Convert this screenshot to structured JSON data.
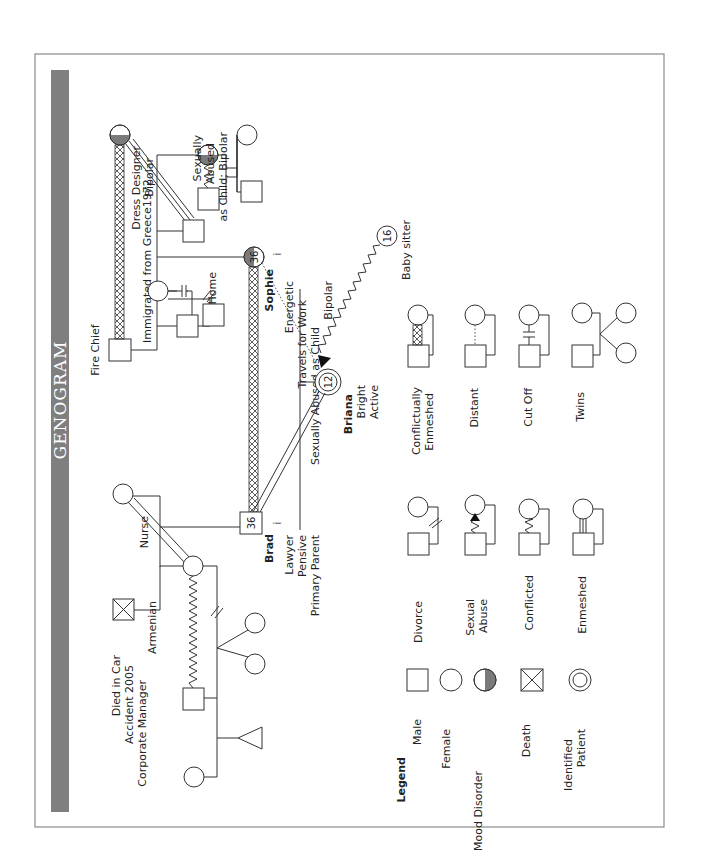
{
  "title": "GENOGRAM",
  "colors": {
    "banner": "#7f7f7f",
    "frame": "#8a8a8a",
    "mood_shade": "#7a7a7a",
    "line": "#333333"
  },
  "people": {
    "paternal_grandfather": {
      "label": "Died in Car Accident 2005 Corporate Manager",
      "lines": [
        "Died in Car",
        "Accident 2005",
        "Corporate Manager"
      ],
      "symbol": "male-deceased"
    },
    "paternal_grandmother": {
      "label": "Armenian",
      "symbol": "female"
    },
    "nurse": {
      "label": "Nurse",
      "symbol": "female"
    },
    "brad": {
      "name": "Brad",
      "age": "36",
      "sep": "i",
      "lines": [
        "Lawyer",
        "Pensive",
        "Primary Parent"
      ],
      "symbol": "male"
    },
    "sophie": {
      "name": "Sophie",
      "age": "36",
      "sep": "i",
      "lines": [
        "Energetic",
        "Travels for Work",
        "Sexually Abused as Child",
        "Bipolar"
      ],
      "symbol": "female-mood"
    },
    "briana": {
      "name": "Briana",
      "age": "12",
      "lines": [
        "Bright",
        "Active"
      ],
      "symbol": "identified-patient"
    },
    "babysitter": {
      "age": "16",
      "label": "Baby sitter",
      "symbol": "female"
    },
    "fire_chief": {
      "label": "Fire Chief",
      "symbol": "male"
    },
    "dress_designer": {
      "lines": [
        "Dress Designer",
        "Bipolar"
      ],
      "symbol": "female-mood"
    },
    "at_home": {
      "label": "At Home",
      "symbol": "male"
    },
    "aunt": {
      "lines": [
        "Sexually",
        "Abused",
        "as Child; Bipolar"
      ],
      "symbol": "female-mood"
    },
    "immigration_note": "Immigrated from Greece1972"
  },
  "legend": {
    "title": "Legend",
    "symbols": [
      {
        "label": "Male",
        "shape": "square"
      },
      {
        "label": "Female",
        "shape": "circle"
      },
      {
        "label": "Mood Disorder",
        "shape": "half-shaded-circle"
      },
      {
        "label": "Death",
        "shape": "crossed-square"
      },
      {
        "label": "Identified Patient",
        "lines": [
          "Identified",
          "Patient"
        ],
        "shape": "double-circle"
      }
    ],
    "relationships": [
      {
        "label": "Divorce",
        "lines": [
          "Divorce"
        ]
      },
      {
        "label": "Sexual Abuse",
        "lines": [
          "Sexual",
          "Abuse"
        ]
      },
      {
        "label": "Conflicted",
        "lines": [
          "Conflicted"
        ]
      },
      {
        "label": "Enmeshed",
        "lines": [
          "Enmeshed"
        ]
      },
      {
        "label": "Conflictually Enmeshed",
        "lines": [
          "Conflictually",
          "Enmeshed"
        ]
      },
      {
        "label": "Distant",
        "lines": [
          "Distant"
        ]
      },
      {
        "label": "Cut Off",
        "lines": [
          "Cut Off"
        ]
      },
      {
        "label": "Twins",
        "lines": [
          "Twins"
        ]
      }
    ]
  }
}
